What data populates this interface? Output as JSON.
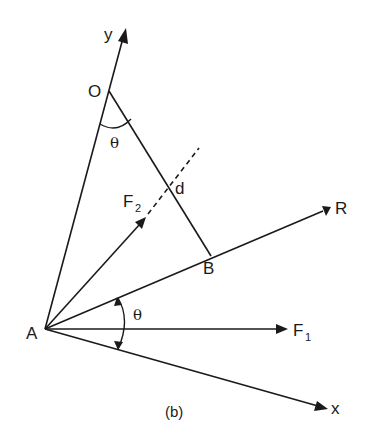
{
  "labels": {
    "A": "A",
    "O": "O",
    "B": "B",
    "d": "d",
    "y": "y",
    "x": "x",
    "R": "R",
    "F1_main": "F",
    "F1_sub": "1",
    "F2_main": "F",
    "F2_sub": "2",
    "theta_top": "θ",
    "theta_bottom": "θ",
    "caption": "(b)"
  },
  "colors": {
    "ink": "#1a1a1a",
    "background": "#ffffff"
  }
}
